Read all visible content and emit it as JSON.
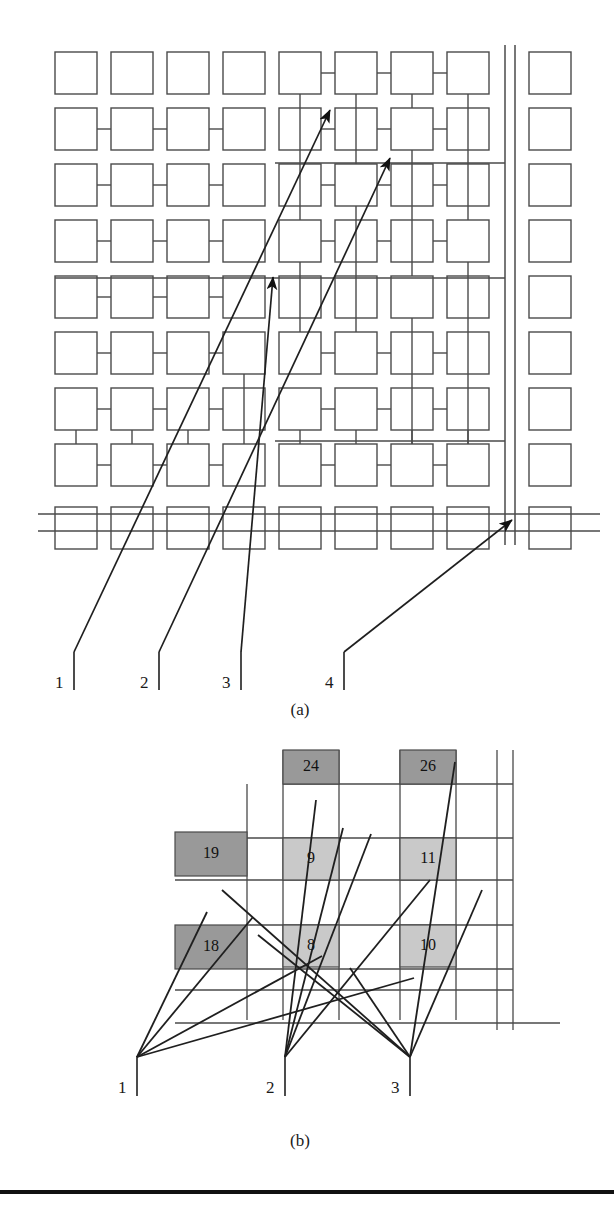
{
  "figure": {
    "panels": [
      {
        "id": "a",
        "caption": "(a)",
        "caption_x": 300,
        "caption_y": 700
      },
      {
        "id": "b",
        "caption": "(b)",
        "caption_x": 300,
        "caption_y": 1131
      }
    ]
  },
  "panel_a": {
    "caption": "(a)",
    "grid": {
      "cols": 8,
      "rows": 9,
      "cell_size": 42,
      "col_pitch": 56,
      "row_pitch": 56,
      "origin_x": 55,
      "origin_y": 52,
      "extra_column_x": 529,
      "extra_column_count": 9
    },
    "double_vertical_lines_x": [
      505,
      515
    ],
    "double_horizontal_lines_y": [
      514,
      531
    ],
    "leader_labels": [
      {
        "label": "1",
        "text_x": 55,
        "text_y": 690,
        "tick_x": 74,
        "tick_y1": 652,
        "tick_y2": 690
      },
      {
        "label": "2",
        "text_x": 140,
        "text_y": 690,
        "tick_x": 159,
        "tick_y1": 652,
        "tick_y2": 690
      },
      {
        "label": "3",
        "text_x": 222,
        "text_y": 690,
        "tick_x": 241,
        "tick_y1": 652,
        "tick_y2": 690
      },
      {
        "label": "4",
        "text_x": 325,
        "text_y": 690,
        "tick_x": 344,
        "tick_y1": 652,
        "tick_y2": 690
      }
    ],
    "arrows": [
      {
        "from_label": "1",
        "x1": 74,
        "y1": 652,
        "x2": 330,
        "y2": 110
      },
      {
        "from_label": "2",
        "x1": 159,
        "y1": 652,
        "x2": 390,
        "y2": 158
      },
      {
        "from_label": "3",
        "x1": 241,
        "y1": 652,
        "x2": 273,
        "y2": 277
      },
      {
        "from_label": "4",
        "x1": 344,
        "y1": 652,
        "x2": 512,
        "y2": 520
      }
    ]
  },
  "panel_b": {
    "caption": "(b)",
    "cells": [
      {
        "value": "24",
        "x": 283,
        "y": 750,
        "w": 56,
        "h": 34,
        "fill": "#999999",
        "kind": "dark"
      },
      {
        "value": "26",
        "x": 400,
        "y": 750,
        "w": 56,
        "h": 34,
        "fill": "#999999",
        "kind": "dark"
      },
      {
        "value": "19",
        "x": 175,
        "y": 832,
        "w": 72,
        "h": 44,
        "fill": "#999999",
        "kind": "dark"
      },
      {
        "value": "9",
        "x": 283,
        "y": 838,
        "w": 56,
        "h": 42,
        "fill": "#c9c9c9",
        "kind": "light"
      },
      {
        "value": "11",
        "x": 400,
        "y": 838,
        "w": 56,
        "h": 42,
        "fill": "#c9c9c9",
        "kind": "light"
      },
      {
        "value": "18",
        "x": 175,
        "y": 925,
        "w": 72,
        "h": 44,
        "fill": "#999999",
        "kind": "dark"
      },
      {
        "value": "8",
        "x": 283,
        "y": 925,
        "w": 56,
        "h": 42,
        "fill": "#c9c9c9",
        "kind": "light"
      },
      {
        "value": "10",
        "x": 400,
        "y": 925,
        "w": 56,
        "h": 42,
        "fill": "#c9c9c9",
        "kind": "light"
      }
    ],
    "leader_labels": [
      {
        "label": "1",
        "text_x": 118,
        "text_y": 1095,
        "tick_x": 137,
        "tick_y1": 1056,
        "tick_y2": 1096
      },
      {
        "label": "2",
        "text_x": 266,
        "text_y": 1095,
        "tick_x": 285,
        "tick_y1": 1056,
        "tick_y2": 1096
      },
      {
        "label": "3",
        "text_x": 391,
        "text_y": 1095,
        "tick_x": 410,
        "tick_y1": 1056,
        "tick_y2": 1096
      }
    ],
    "fan_lines": [
      {
        "from_label": "1",
        "x1": 137,
        "y1": 1057,
        "x2": 207,
        "y2": 912
      },
      {
        "from_label": "1",
        "x1": 137,
        "y1": 1057,
        "x2": 253,
        "y2": 917
      },
      {
        "from_label": "1",
        "x1": 137,
        "y1": 1057,
        "x2": 322,
        "y2": 956
      },
      {
        "from_label": "1",
        "x1": 137,
        "y1": 1057,
        "x2": 414,
        "y2": 978
      },
      {
        "from_label": "2",
        "x1": 285,
        "y1": 1057,
        "x2": 316,
        "y2": 800
      },
      {
        "from_label": "2",
        "x1": 285,
        "y1": 1057,
        "x2": 343,
        "y2": 828
      },
      {
        "from_label": "2",
        "x1": 285,
        "y1": 1057,
        "x2": 371,
        "y2": 834
      },
      {
        "from_label": "2",
        "x1": 285,
        "y1": 1057,
        "x2": 430,
        "y2": 880
      },
      {
        "from_label": "3",
        "x1": 410,
        "y1": 1057,
        "x2": 222,
        "y2": 890
      },
      {
        "from_label": "3",
        "x1": 410,
        "y1": 1057,
        "x2": 258,
        "y2": 935
      },
      {
        "from_label": "3",
        "x1": 410,
        "y1": 1057,
        "x2": 350,
        "y2": 968
      },
      {
        "from_label": "3",
        "x1": 410,
        "y1": 1057,
        "x2": 455,
        "y2": 762
      },
      {
        "from_label": "3",
        "x1": 410,
        "y1": 1057,
        "x2": 482,
        "y2": 890
      }
    ]
  },
  "bottom_rule": {
    "y": 1190,
    "height": 4,
    "color": "#111111"
  }
}
